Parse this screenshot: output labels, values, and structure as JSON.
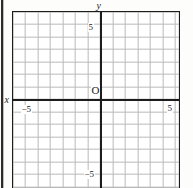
{
  "figure": {
    "type": "cartesian-coordinate-grid",
    "background_color": "#fdfdfc",
    "grid_line_color": "#b9b9b9",
    "axis_color": "#1c1c1c",
    "border_color": "#1c1c1c"
  },
  "axes": {
    "x_axis_label": "x",
    "y_axis_label": "y",
    "origin_label": "O"
  },
  "ticks": {
    "y_positive": "5",
    "y_negative": "−5",
    "x_positive": "5",
    "x_negative": "−5"
  },
  "chart_data": {
    "type": "scatter",
    "title": "",
    "xlabel": "x",
    "ylabel": "y",
    "xlim": [
      -7,
      6
    ],
    "ylim": [
      -7,
      7
    ],
    "xticks": [
      -5,
      5
    ],
    "yticks": [
      -5,
      5
    ],
    "xticklabels": [
      "−5",
      "5"
    ],
    "yticklabels": [
      "−5",
      "5"
    ],
    "grid": true,
    "grid_spacing": 1,
    "legend": null,
    "series": [],
    "annotations": [
      {
        "text": "O",
        "x": 0,
        "y": 0,
        "note": "origin label, placed up-left of the origin"
      },
      {
        "text": "y",
        "x": 0,
        "y": 7,
        "note": "y-axis name at top of vertical axis"
      },
      {
        "text": "x",
        "x": -7,
        "y": 0,
        "note": "x-axis name at left of horizontal axis"
      }
    ]
  }
}
